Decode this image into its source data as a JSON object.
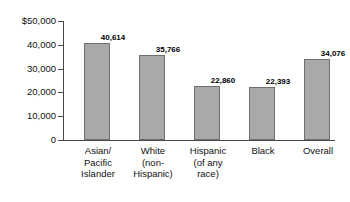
{
  "chart_data": {
    "type": "bar",
    "title": "",
    "xlabel": "",
    "ylabel": "",
    "categories": [
      "Asian/ Pacific Islander",
      "White (non-Hispanic)",
      "Hispanic (of any race)",
      "Black",
      "Overall"
    ],
    "category_lines": [
      [
        "Asian/",
        "Pacific",
        "Islander"
      ],
      [
        "White",
        "(non-",
        "Hispanic)"
      ],
      [
        "Hispanic",
        "(of any",
        "race)"
      ],
      [
        "Black"
      ],
      [
        "Overall"
      ]
    ],
    "values": [
      40614,
      35766,
      22860,
      22393,
      34076
    ],
    "value_labels": [
      "40,614",
      "35,766",
      "22,860",
      "22,393",
      "34,076"
    ],
    "ylim": [
      0,
      50000
    ],
    "ytick_values": [
      50000,
      40000,
      30000,
      20000,
      10000,
      0
    ],
    "ytick_labels": [
      "$50,000",
      "40,000",
      "30,000",
      "20,000",
      "10,000",
      "0"
    ],
    "grid": false,
    "legend": null,
    "bar_color": "#a9a9a9",
    "bar_border_color": "#6f6f6f",
    "axis_color": "#4a4a4a",
    "background_color": "#ffffff"
  }
}
